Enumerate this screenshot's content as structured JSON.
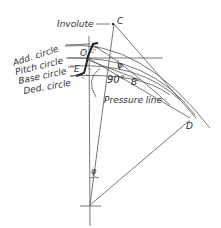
{
  "diagram": {
    "type": "involute gear tooth geometry",
    "labels": {
      "involute": "Involute",
      "add_circle": "Add. circle",
      "pitch_circle": "Pitch circle",
      "base_circle": "Base circle",
      "ded_circle": "Ded. circle",
      "pressure_line": "Pressure line",
      "point_c": "C",
      "point_o": "O",
      "point_e": "E",
      "point_b": "B",
      "point_d": "D",
      "angle_phi": "φ",
      "angle_psi": "φ",
      "right_angle": "90°"
    },
    "colors": {
      "line": "#555555",
      "tooth": "#222222",
      "text": "#333333"
    }
  }
}
